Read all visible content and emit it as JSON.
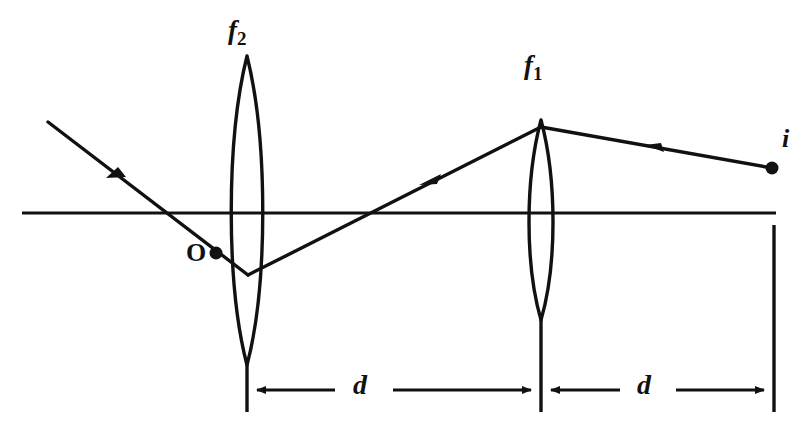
{
  "figure": {
    "background_color": "#ffffff",
    "stroke_color": "#111111",
    "width": 804,
    "height": 427
  },
  "labels": {
    "lens_left": {
      "base": "f",
      "subscript": "2",
      "name": "f2"
    },
    "lens_right": {
      "base": "f",
      "subscript": "1",
      "name": "f1"
    },
    "object_point": "O",
    "image_point": "i",
    "distance_left": "d",
    "distance_right": "d"
  },
  "geometry": {
    "optical_axis": {
      "x1": 22,
      "y1": 213,
      "x2": 776,
      "y2": 213
    },
    "lens_left": {
      "center_x": 247,
      "top_y": 56,
      "bottom_y": 365,
      "half_width": 20
    },
    "lens_right": {
      "center_x": 541,
      "top_y": 120,
      "bottom_y": 320,
      "half_width": 15
    },
    "points": {
      "object": {
        "x": 216,
        "y": 253,
        "radius": 6
      },
      "image": {
        "x": 772,
        "y": 168,
        "radius": 6
      }
    },
    "rays": [
      {
        "name": "incoming-ray-right",
        "x1": 772,
        "y1": 168,
        "x2": 541,
        "y2": 127,
        "arrow_at": 0.49
      },
      {
        "name": "middle-ray",
        "x1": 541,
        "y1": 127,
        "x2": 248,
        "y2": 275,
        "arrow_at": 0.38
      },
      {
        "name": "outgoing-ray-left",
        "x1": 248,
        "y1": 275,
        "x2": 48,
        "y2": 122,
        "arrow_at": 0.67
      }
    ],
    "reference_ticks": [
      {
        "name": "tick-lens-left",
        "x": 247,
        "y1": 360,
        "y2": 412
      },
      {
        "name": "tick-lens-right",
        "x": 541,
        "y1": 343,
        "y2": 412
      },
      {
        "name": "tick-image-plane",
        "x": 774,
        "y1": 225,
        "y2": 412
      }
    ],
    "dimension_arrows": [
      {
        "name": "dimension-d-left",
        "x1": 247,
        "x2": 541,
        "y": 390
      },
      {
        "name": "dimension-d-right",
        "x1": 541,
        "x2": 774,
        "y": 390
      }
    ]
  }
}
